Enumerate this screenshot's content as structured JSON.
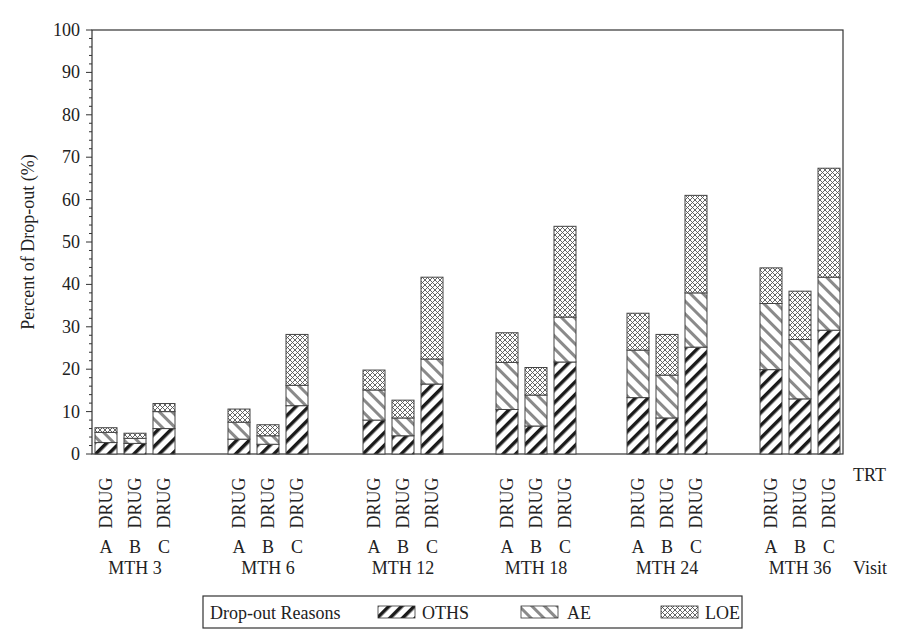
{
  "chart_data": {
    "type": "bar",
    "stacked": true,
    "title": "",
    "xlabel": "Visit",
    "ylabel": "Percent of Drop-out (%)",
    "ylim": [
      0,
      100
    ],
    "yticks": [
      0,
      10,
      20,
      30,
      40,
      50,
      60,
      70,
      80,
      90,
      100
    ],
    "grid": false,
    "group_axis_label": "Visit",
    "sub_axis_label": "TRT",
    "groups": [
      "MTH 3",
      "MTH 6",
      "MTH 12",
      "MTH 18",
      "MTH 24",
      "MTH 36"
    ],
    "treatments": [
      "DRUG A",
      "DRUG B",
      "DRUG C"
    ],
    "treatment_prefix": "DRUG",
    "treatment_letters": [
      "A",
      "B",
      "C"
    ],
    "series": [
      {
        "name": "OTHS",
        "pattern": "dark-diagonal",
        "values": [
          [
            2.7,
            2.5,
            6.0
          ],
          [
            3.5,
            2.3,
            11.4
          ],
          [
            8.0,
            4.3,
            16.5
          ],
          [
            10.5,
            6.6,
            21.7
          ],
          [
            13.3,
            8.5,
            25.2
          ],
          [
            19.9,
            13.0,
            29.2
          ]
        ]
      },
      {
        "name": "AE",
        "pattern": "light-diagonal",
        "values": [
          [
            2.4,
            1.2,
            4.0
          ],
          [
            4.0,
            2.0,
            4.8
          ],
          [
            7.1,
            4.2,
            5.9
          ],
          [
            11.1,
            7.3,
            10.6
          ],
          [
            11.2,
            10.1,
            12.8
          ],
          [
            15.6,
            14.0,
            12.5
          ]
        ]
      },
      {
        "name": "LOE",
        "pattern": "crosshatch",
        "values": [
          [
            1.1,
            1.2,
            1.9
          ],
          [
            3.1,
            2.6,
            12.0
          ],
          [
            4.7,
            4.2,
            19.3
          ],
          [
            7.0,
            6.5,
            21.4
          ],
          [
            8.7,
            9.6,
            23.0
          ],
          [
            8.4,
            11.4,
            25.7
          ]
        ]
      }
    ],
    "totals": [
      [
        6.2,
        4.9,
        11.9
      ],
      [
        10.6,
        6.9,
        28.2
      ],
      [
        19.8,
        12.7,
        41.7
      ],
      [
        28.6,
        20.4,
        53.7
      ],
      [
        33.2,
        28.2,
        61.0
      ],
      [
        43.9,
        38.4,
        67.4
      ]
    ],
    "legend": {
      "title": "Drop-out Reasons",
      "entries": [
        "OTHS",
        "AE",
        "LOE"
      ],
      "position": "bottom"
    }
  },
  "axis": {
    "ylabel": "Percent of Drop-out (%)",
    "trt_label": "TRT",
    "visit_label": "Visit"
  },
  "legend": {
    "title": "Drop-out Reasons",
    "oths": "OTHS",
    "ae": "AE",
    "loe": "LOE"
  }
}
